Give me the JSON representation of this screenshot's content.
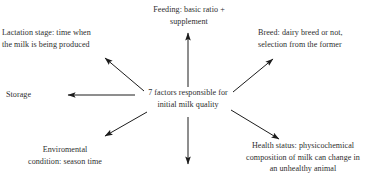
{
  "diagram": {
    "title": "7 factors responsible for initial milk quality",
    "center": {
      "id": "center-node",
      "text": "7 factors responsible for\ninitial milk quality"
    },
    "nodes": [
      {
        "id": "feeding",
        "text": "Feeding: basic ratio +\nsupplement",
        "direction": "up"
      },
      {
        "id": "lactation-stage",
        "text": "Lactation stage: time when\nthe milk is being produced",
        "direction": "up-left"
      },
      {
        "id": "breed",
        "text": "Breed: dairy breed or not,\nselection from the former",
        "direction": "up-right"
      },
      {
        "id": "storage",
        "text": "Storage",
        "direction": "left"
      },
      {
        "id": "environmental-condition",
        "text": "Enviromental\ncondition: season time",
        "direction": "down-left"
      },
      {
        "id": "health-status",
        "text": "Health status: physicochemical\ncomposition of milk can change in\nan unhealthy animal",
        "direction": "down-right"
      },
      {
        "id": "unlabeled-down",
        "text": "",
        "direction": "down"
      }
    ],
    "colors": {
      "text": "#2e2e2e",
      "arrow": "#1c1c1c",
      "background": "#ffffff"
    }
  }
}
